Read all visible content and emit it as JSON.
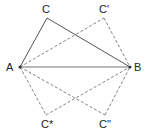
{
  "diagram": {
    "title": "",
    "points": {
      "A": {
        "label": "A",
        "x": 20,
        "y": 67
      },
      "B": {
        "label": "B",
        "x": 130,
        "y": 67
      },
      "C": {
        "label": "C",
        "x": 47,
        "y": 18
      },
      "C1": {
        "label": "C'",
        "x": 104,
        "y": 18
      },
      "C2": {
        "label": "C*",
        "x": 46,
        "y": 115
      },
      "C3": {
        "label": "C\"",
        "x": 105,
        "y": 115
      }
    },
    "solid_segments": [
      [
        "A",
        "B"
      ],
      [
        "A",
        "C"
      ],
      [
        "C",
        "B"
      ]
    ],
    "dashed_segments": [
      [
        "A",
        "C1"
      ],
      [
        "C1",
        "B"
      ],
      [
        "A",
        "C2"
      ],
      [
        "C2",
        "B"
      ],
      [
        "A",
        "C3"
      ],
      [
        "C3",
        "B"
      ]
    ],
    "colors": {
      "solid": "#666666",
      "dashed": "#777777",
      "text": "#222222"
    }
  }
}
